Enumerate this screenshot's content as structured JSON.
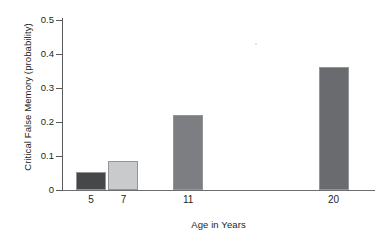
{
  "chart_data": {
    "type": "bar",
    "title": "",
    "subtitle": "",
    "xlabel": "Age in Years",
    "ylabel": "Critical False Memory (probability)",
    "categories": [
      "5",
      "7",
      "11",
      "20"
    ],
    "x": [
      5,
      7,
      11,
      20
    ],
    "values": [
      0.053,
      0.085,
      0.222,
      0.362
    ],
    "series": [
      {
        "name": "Critical False Memory",
        "values": [
          0.053,
          0.085,
          0.222,
          0.362
        ]
      }
    ],
    "bar_colors": [
      "#464749",
      "#c9cacb",
      "#7d7e81",
      "#6a6b6e"
    ],
    "bar_border_color": "#939598",
    "ylim": [
      0,
      0.5
    ],
    "yticks": [
      0,
      0.1,
      0.2,
      0.3,
      0.4,
      0.5
    ],
    "ytick_labels": [
      "0",
      "0.1",
      "0.2",
      "0.3",
      "0.4",
      "0.5"
    ],
    "xlim": [
      3.2,
      22.5
    ],
    "grid": false,
    "legend": false,
    "legend_position": "none",
    "annotations": [],
    "axis_color": "#58595b",
    "text_color": "#231f20",
    "background": "#ffffff"
  }
}
